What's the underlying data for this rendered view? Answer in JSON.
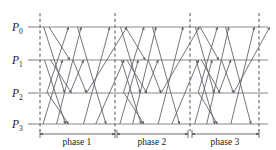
{
  "figure": {
    "width": 276,
    "height": 150,
    "background": "#ffffff"
  },
  "colors": {
    "timeline": "#8a8a8a",
    "divider": "#555555",
    "message_arrow": "#5c5c66",
    "dimension": "#4a4a4a",
    "text": "#1a1a1a"
  },
  "processes": [
    {
      "id": "P0",
      "base": "P",
      "subscript": "0",
      "label": "P",
      "y": 27
    },
    {
      "id": "P1",
      "base": "P",
      "subscript": "1",
      "label": "P",
      "y": 60
    },
    {
      "id": "P2",
      "base": "P",
      "subscript": "2",
      "label": "P",
      "y": 93
    },
    {
      "id": "P3",
      "base": "P",
      "subscript": "3",
      "label": "P",
      "y": 124
    }
  ],
  "timeline": {
    "x_start": 36,
    "x_end": 268
  },
  "dividers": [
    {
      "name": "divider-0",
      "x": 40,
      "y_top": 13,
      "y_bottom": 131
    },
    {
      "name": "divider-1",
      "x": 115,
      "y_top": 13,
      "y_bottom": 131
    },
    {
      "name": "divider-2",
      "x": 190,
      "y_top": 13,
      "y_bottom": 131
    },
    {
      "name": "divider-3",
      "x": 259,
      "y_top": 13,
      "y_bottom": 131
    }
  ],
  "phases": [
    {
      "name": "phase-1",
      "label": "phase 1",
      "x_start": 40,
      "x_end": 115,
      "label_x": 77,
      "label_y": 145
    },
    {
      "name": "phase-2",
      "label": "phase 2",
      "x_start": 117,
      "x_end": 188,
      "label_x": 152,
      "label_y": 145
    },
    {
      "name": "phase-3",
      "label": "phase 3",
      "x_start": 192,
      "x_end": 259,
      "label_x": 225,
      "label_y": 145
    }
  ],
  "dimension_line_y": 134,
  "messages": {
    "description": "Within each phase every process exchanges messages with the other three; arrowheads mark the receiving timeline.",
    "pattern": [
      {
        "from": "P2",
        "to": "P0",
        "x1": 0.09,
        "x2": 0.38
      },
      {
        "from": "P3",
        "to": "P0",
        "x1": 0.22,
        "x2": 0.55
      },
      {
        "from": "P0",
        "to": "P2",
        "x1": 0.05,
        "x2": 0.33
      },
      {
        "from": "P0",
        "to": "P1",
        "x1": 0.12,
        "x2": 0.4
      },
      {
        "from": "P1",
        "to": "P3",
        "x1": 0.06,
        "x2": 0.34
      },
      {
        "from": "P1",
        "to": "P2",
        "x1": 0.14,
        "x2": 0.42
      },
      {
        "from": "P2",
        "to": "P3",
        "x1": 0.1,
        "x2": 0.38
      },
      {
        "from": "P3",
        "to": "P1",
        "x1": 0.04,
        "x2": 0.3
      },
      {
        "from": "P3",
        "to": "P0",
        "x1": 0.58,
        "x2": 0.93
      },
      {
        "from": "P0",
        "to": "P3",
        "x1": 0.5,
        "x2": 0.88
      },
      {
        "from": "P1",
        "to": "P2",
        "x1": 0.44,
        "x2": 0.62
      },
      {
        "from": "P2",
        "to": "P1",
        "x1": 0.4,
        "x2": 0.58
      }
    ],
    "count_per_phase": 12
  },
  "phase_count": 3,
  "process_count": 4
}
